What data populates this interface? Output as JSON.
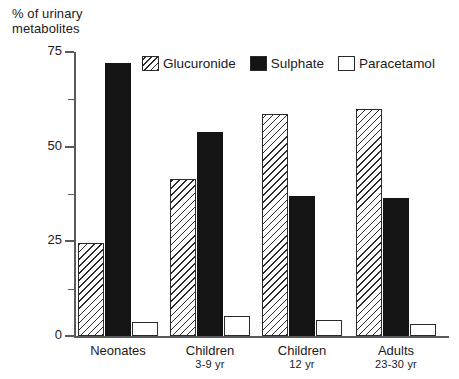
{
  "chart_data": {
    "type": "bar",
    "title": "% of urinary\nmetabolites",
    "xlabel": "",
    "ylabel": "% of urinary metabolites",
    "ylim": [
      0,
      75
    ],
    "grid": false,
    "legend_position": "top-center",
    "y_major_ticks": [
      0,
      25,
      50,
      75
    ],
    "y_minor_ticks": [
      12.5,
      37.5,
      62.5
    ],
    "y_tick_labels": [
      "0",
      "25",
      "50",
      "75"
    ],
    "categories": [
      "Neonates",
      "Children 3-9 yr",
      "Children 12 yr",
      "Adults 23-30 yr"
    ],
    "category_lines": [
      {
        "main": "Neonates",
        "sub": ""
      },
      {
        "main": "Children",
        "sub": "3-9  yr"
      },
      {
        "main": "Children",
        "sub": "12  yr"
      },
      {
        "main": "Adults",
        "sub": "23-30 yr"
      }
    ],
    "series": [
      {
        "name": "Glucuronide",
        "pattern": "diagonal-hatch",
        "values": [
          24.5,
          41.5,
          58.5,
          60
        ]
      },
      {
        "name": "Sulphate",
        "pattern": "solid-black",
        "values": [
          72,
          54,
          37,
          36.5
        ]
      },
      {
        "name": "Paracetamol",
        "pattern": "open-white",
        "values": [
          3.7,
          5.3,
          4.3,
          3.3
        ]
      }
    ]
  },
  "legend": {
    "items": [
      {
        "label": "Glucuronide",
        "swatch": "hatched-swatch"
      },
      {
        "label": "Sulphate",
        "swatch": "black-swatch"
      },
      {
        "label": "Paracetamol",
        "swatch": "white-swatch"
      }
    ]
  },
  "colors": {
    "ink": "#2b2b2b",
    "axis": "#5a5a5a",
    "sulphate_fill": "#141414",
    "background": "#ffffff"
  }
}
